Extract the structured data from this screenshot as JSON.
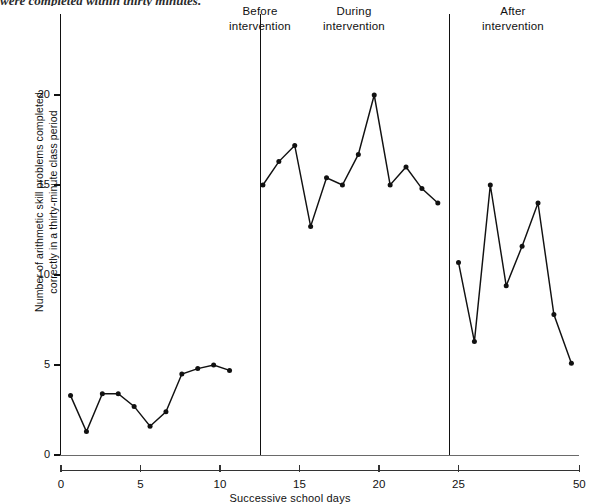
{
  "caption": "were completed within thirty minutes.",
  "phases": [
    {
      "name": "before",
      "line1": "Before",
      "line2": "intervention"
    },
    {
      "name": "during",
      "line1": "During",
      "line2": "intervention"
    },
    {
      "name": "after",
      "line1": "After",
      "line2": "intervention"
    }
  ],
  "axis": {
    "y_title_line1": "Number of arithmetic skill problems completed",
    "y_title_line2": "correctly in a thirty-minute class period",
    "x_title": "Successive school days"
  },
  "colors": {
    "ink": "#111111",
    "axis": "#333333",
    "background": "#ffffff"
  },
  "chart_data": {
    "type": "line",
    "title": "",
    "xlabel": "Successive school days",
    "ylabel": "Number of arithmetic skill problems completed correctly in a thirty-minute class period",
    "xlim": [
      0,
      32.6
    ],
    "ylim": [
      0,
      22.6
    ],
    "xticks": [
      0,
      5,
      10,
      15,
      20,
      25,
      50
    ],
    "xtick_positions": [
      0,
      5,
      10,
      15,
      20,
      25,
      32.6
    ],
    "yticks": [
      0,
      5,
      10,
      15,
      20
    ],
    "grid": false,
    "legend": false,
    "phase_dividers": [
      12.5,
      24.4
    ],
    "series": [
      {
        "name": "Before intervention",
        "x": [
          0.6,
          1.6,
          2.6,
          3.6,
          4.6,
          5.6,
          6.6,
          7.6,
          8.6,
          9.6,
          10.6
        ],
        "values": [
          3.3,
          1.3,
          3.4,
          3.4,
          2.7,
          1.6,
          2.4,
          4.5,
          4.8,
          5.0,
          4.7
        ]
      },
      {
        "name": "During intervention",
        "x": [
          12.7,
          13.7,
          14.7,
          15.7,
          16.7,
          17.7,
          18.7,
          19.7,
          20.7,
          21.7,
          22.7,
          23.7
        ],
        "values": [
          15.0,
          16.3,
          17.2,
          12.7,
          15.4,
          15.0,
          16.7,
          20.0,
          15.0,
          16.0,
          14.8,
          14.0
        ]
      },
      {
        "name": "After intervention",
        "x": [
          25.0,
          26.0,
          27.0,
          28.0,
          29.0,
          30.0,
          31.0,
          32.1
        ],
        "values": [
          10.7,
          6.3,
          15.0,
          9.4,
          11.6,
          14.0,
          7.8,
          5.1
        ]
      }
    ]
  }
}
